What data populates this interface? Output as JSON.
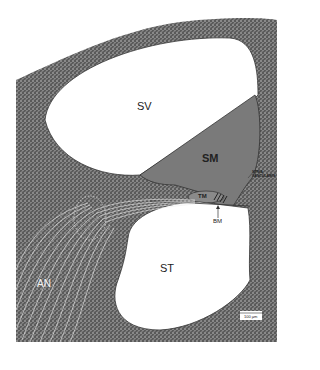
{
  "figure": {
    "type": "cochlea cross-section diagram",
    "colors": {
      "bone_stipple": "#4a4a4a",
      "scala_media": "#7a7a7a",
      "background": "#ffffff",
      "outline": "#333333"
    },
    "labels": {
      "sv": "SV",
      "sm": "SM",
      "st": "ST",
      "tm": "TM",
      "bm": "BM",
      "an": "AN",
      "stria_line1": "STRIA",
      "stria_line2": "VASCULARIS"
    },
    "scale_bar": {
      "label": "100 µm"
    }
  }
}
